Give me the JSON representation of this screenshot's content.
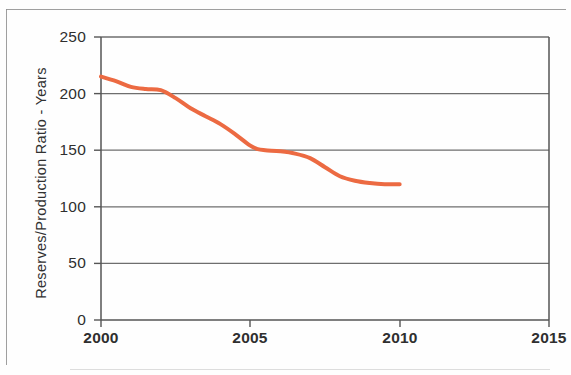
{
  "chart_data": {
    "type": "line",
    "title": "",
    "subtitle": "",
    "xlabel": "",
    "ylabel": "Reserves/Production Ratio - Years",
    "xlim": [
      2000,
      2015
    ],
    "ylim": [
      0,
      250
    ],
    "grid": true,
    "grid_axis": "y",
    "legend": false,
    "legend_position": "none",
    "x_ticks": [
      2000,
      2005,
      2010,
      2015
    ],
    "x_tick_labels": [
      "2000",
      "2005",
      "2010",
      "2015"
    ],
    "y_ticks": [
      0,
      50,
      100,
      150,
      200,
      250
    ],
    "y_tick_labels": [
      "0",
      "50",
      "100",
      "150",
      "200",
      "250"
    ],
    "series": [
      {
        "name": "Reserves/Production Ratio",
        "color": "#ec6a42",
        "line_width": 4,
        "x": [
          2000,
          2000.5,
          2001,
          2001.5,
          2002,
          2002.5,
          2003,
          2003.5,
          2004,
          2004.5,
          2005,
          2005.25,
          2005.5,
          2006,
          2006.5,
          2007,
          2007.5,
          2008,
          2008.5,
          2009,
          2009.5,
          2010
        ],
        "values": [
          215,
          211,
          206,
          204,
          203,
          196,
          187,
          180,
          173,
          164,
          154,
          151,
          150,
          149,
          147,
          143,
          135,
          127,
          123,
          121,
          120,
          120
        ]
      }
    ]
  },
  "axes": {
    "y_axis_title": "Reserves/Production Ratio - Years",
    "y_tick_labels": [
      "250",
      "200",
      "150",
      "100",
      "50",
      "0"
    ],
    "x_tick_labels": [
      "2000",
      "2005",
      "2010",
      "2015"
    ]
  },
  "colors": {
    "series_line": "#ec6a42",
    "gridline": "#6e6e6e",
    "axis": "#555555",
    "text": "#2f2f2f",
    "background": "#fefefe",
    "page_border": "#8e8e8e"
  }
}
